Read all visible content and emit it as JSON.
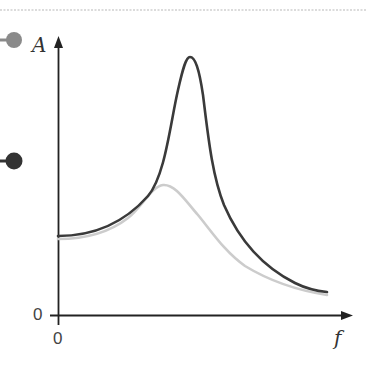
{
  "diagram": {
    "y_axis": {
      "label": "A",
      "origin_label": "0"
    },
    "x_axis": {
      "label": "f",
      "origin_label": "0"
    },
    "curves": [
      {
        "name": "low-damping",
        "color": "#3a3a3a",
        "peak": "sharp, high"
      },
      {
        "name": "high-damping",
        "color": "#c8c8c8",
        "peak": "broad, low"
      }
    ],
    "handles": [
      {
        "name": "gray-handle",
        "color": "#888888"
      },
      {
        "name": "dark-handle",
        "color": "#333333"
      }
    ],
    "colors": {
      "axis": "#222222",
      "dotted_rule": "#cccccc"
    }
  }
}
